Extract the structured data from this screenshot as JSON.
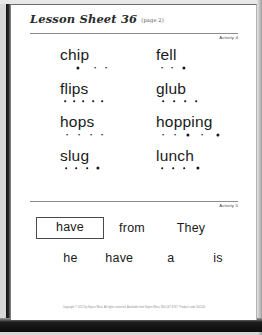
{
  "page": {
    "title": "Lesson Sheet 36",
    "subtitle": "(page 2)",
    "footer": "Copyright © 2012 by Sopris West. All rights reserved. Available from Sopris West, 800-547-6747. Product code 16C545"
  },
  "activity4": {
    "label": "Activity 4",
    "rows": [
      {
        "left": {
          "word": "chip",
          "dots": [
            {
              "size": "lg",
              "x": 18
            },
            {
              "size": "sm",
              "x": 35
            },
            {
              "size": "sm",
              "x": 46
            }
          ]
        },
        "right": {
          "word": "fell",
          "dots": [
            {
              "size": "sm",
              "x": 6
            },
            {
              "size": "sm",
              "x": 16
            },
            {
              "size": "lg",
              "x": 28
            }
          ]
        }
      },
      {
        "left": {
          "word": "flips",
          "dots": [
            {
              "size": "sm",
              "x": 5
            },
            {
              "size": "sm",
              "x": 14
            },
            {
              "size": "sm",
              "x": 23
            },
            {
              "size": "sm",
              "x": 33
            },
            {
              "size": "sm",
              "x": 42
            }
          ]
        },
        "right": {
          "word": "glub",
          "dots": [
            {
              "size": "sm",
              "x": 7
            },
            {
              "size": "sm",
              "x": 18
            },
            {
              "size": "sm",
              "x": 29
            },
            {
              "size": "sm",
              "x": 40
            }
          ]
        }
      },
      {
        "left": {
          "word": "hops",
          "dots": [
            {
              "size": "sm",
              "x": 7
            },
            {
              "size": "sm",
              "x": 19
            },
            {
              "size": "sm",
              "x": 31
            },
            {
              "size": "sm",
              "x": 42
            }
          ]
        },
        "right": {
          "word": "hopping",
          "dots": [
            {
              "size": "sm",
              "x": 7
            },
            {
              "size": "sm",
              "x": 19
            },
            {
              "size": "lg",
              "x": 32
            },
            {
              "size": "sm",
              "x": 46
            },
            {
              "size": "lg",
              "x": 62
            }
          ]
        }
      },
      {
        "left": {
          "word": "slug",
          "dots": [
            {
              "size": "sm",
              "x": 6
            },
            {
              "size": "sm",
              "x": 16
            },
            {
              "size": "sm",
              "x": 27
            },
            {
              "size": "lg",
              "x": 38
            }
          ]
        },
        "right": {
          "word": "lunch",
          "dots": [
            {
              "size": "sm",
              "x": 6
            },
            {
              "size": "sm",
              "x": 17
            },
            {
              "size": "sm",
              "x": 28
            },
            {
              "size": "lg",
              "x": 42
            }
          ]
        }
      }
    ]
  },
  "activity5": {
    "label": "Activity 5",
    "row1": [
      {
        "text": "have",
        "boxed": true
      },
      {
        "text": "from",
        "boxed": false
      },
      {
        "text": "They",
        "boxed": false
      }
    ],
    "row2": [
      {
        "text": "he",
        "boxed": false
      },
      {
        "text": "have",
        "boxed": false
      },
      {
        "text": "a",
        "boxed": false
      },
      {
        "text": "is",
        "boxed": false
      }
    ]
  },
  "colors": {
    "ink": "#1a1a1a",
    "rule": "#8b8b8b",
    "paper": "#ffffff"
  }
}
